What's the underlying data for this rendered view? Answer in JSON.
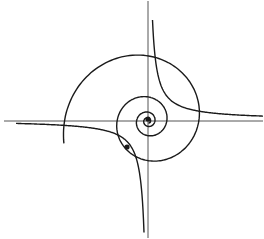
{
  "diagram": {
    "background": "#ffffff",
    "stroke_color": "#1a1a1a",
    "axis_color": "#555555",
    "origin": [
      148,
      120
    ],
    "axes": {
      "x_axis": {
        "from": [
          4,
          121
        ],
        "to": [
          263,
          121
        ]
      },
      "y_axis": {
        "from": [
          148,
          1
        ],
        "to": [
          148,
          238
        ]
      }
    },
    "spiral": {
      "outer_end": [
        61,
        143
      ],
      "start_radius": 87,
      "quarter_turn_ratio": 0.78,
      "quarter_turns": 15
    },
    "hyperbola_branches": [
      {
        "quadrant": "I",
        "k": 450,
        "x_range": [
          4,
          115
        ]
      },
      {
        "quadrant": "III",
        "k": 450,
        "x_range": [
          -132,
          -4
        ]
      }
    ],
    "points": [
      {
        "name": "origin-point",
        "xy": [
          148,
          119
        ]
      },
      {
        "name": "intersection-point",
        "xy": [
          127,
          147
        ]
      }
    ]
  }
}
